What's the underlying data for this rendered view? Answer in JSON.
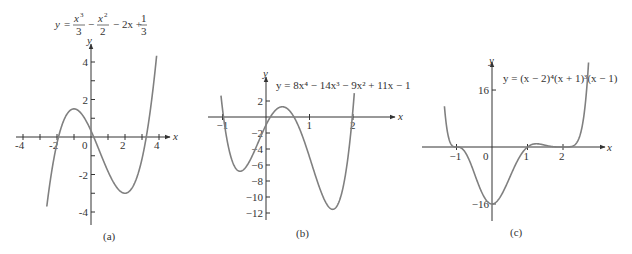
{
  "chart_data": [
    {
      "id": "a",
      "type": "line",
      "caption": "(a)",
      "title": "y = x^3/3 - x^2/2 - 2x + 1/3",
      "equation": {
        "y": "y",
        "eq": "=",
        "t1_num": "x",
        "t1_exp": "3",
        "t1_den": "3",
        "op1": "−",
        "t2_num": "x",
        "t2_exp": "2",
        "t2_den": "2",
        "rest": "− 2x +",
        "t3_num": "1",
        "t3_den": "3"
      },
      "xlabel": "x",
      "ylabel": "y",
      "xlim": [
        -4.2,
        4.6
      ],
      "ylim": [
        -4.7,
        5.0
      ],
      "x_ticks": [
        -4,
        -3,
        -2,
        -1,
        1,
        2,
        3,
        4
      ],
      "x_tick_labels": [
        {
          "v": -4,
          "t": "-4"
        },
        {
          "v": -2,
          "t": "-2"
        },
        {
          "v": 0,
          "t": "0"
        },
        {
          "v": 2,
          "t": "2"
        },
        {
          "v": 4,
          "t": "4"
        }
      ],
      "y_ticks": [
        -4,
        -3,
        -2,
        -1,
        1,
        2,
        3,
        4
      ],
      "y_tick_labels": [
        {
          "v": 4,
          "t": "4"
        },
        {
          "v": 2,
          "t": "2"
        },
        {
          "v": -2,
          "t": "-2"
        },
        {
          "v": -4,
          "t": "-4"
        }
      ],
      "x": [
        -2.6,
        -2,
        -1,
        0,
        1,
        2,
        3,
        3.85
      ],
      "values": [
        -4.37,
        -0.33,
        1.5,
        0.33,
        -1.83,
        -3.0,
        -1.17,
        4.35
      ],
      "grid": false
    },
    {
      "id": "b",
      "type": "line",
      "caption": "(b)",
      "title": "y = 8x^4 − 14x^3 − 9x^2 + 11x − 1",
      "equation_text": "y = 8x⁴ − 14x³ − 9x² + 11x − 1",
      "xlabel": "x",
      "ylabel": "y",
      "xlim": [
        -1.0,
        3.0
      ],
      "ylim": [
        -13.5,
        4.5
      ],
      "x_ticks": [
        -1,
        1,
        2
      ],
      "x_tick_labels": [
        {
          "v": -1,
          "t": "−1"
        },
        {
          "v": 1,
          "t": "1"
        },
        {
          "v": 2,
          "t": "2"
        }
      ],
      "y_ticks": [
        2,
        -2,
        -4,
        -6,
        -8,
        -10,
        -12
      ],
      "y_tick_labels": [
        {
          "v": 2,
          "t": "2"
        },
        {
          "v": -2,
          "t": "−2"
        },
        {
          "v": -4,
          "t": "−4"
        },
        {
          "v": -6,
          "t": "−6"
        },
        {
          "v": -8,
          "t": "−8"
        },
        {
          "v": -10,
          "t": "−10"
        },
        {
          "v": -12,
          "t": "−12"
        }
      ],
      "x": [
        -1,
        -0.6,
        0,
        0.3,
        1,
        1.5,
        2
      ],
      "values": [
        3,
        -6.7,
        -1,
        1.4,
        -5,
        -11.2,
        1
      ],
      "grid": false
    },
    {
      "id": "c",
      "type": "line",
      "caption": "(c)",
      "title": "y = (x − 2)^4(x + 1)^3(x − 1)",
      "equation_text": "y = (x − 2)⁴(x + 1)³(x − 1)",
      "xlabel": "x",
      "ylabel": "y",
      "xlim": [
        -2.0,
        3.2
      ],
      "ylim": [
        -20.5,
        24
      ],
      "x_ticks": [
        -1,
        1,
        2
      ],
      "x_tick_labels": [
        {
          "v": -1,
          "t": "−1"
        },
        {
          "v": 0,
          "t": "0"
        },
        {
          "v": 1,
          "t": "1"
        },
        {
          "v": 2,
          "t": "2"
        }
      ],
      "y_ticks": [
        16,
        -16
      ],
      "y_tick_labels": [
        {
          "v": 16,
          "t": "16"
        },
        {
          "v": -16,
          "t": "−16"
        }
      ],
      "x": [
        -1.35,
        -1,
        0,
        1,
        1.3,
        2,
        2.75
      ],
      "values": [
        24,
        0,
        -16,
        0,
        0.6,
        0,
        21
      ],
      "grid": false
    }
  ]
}
